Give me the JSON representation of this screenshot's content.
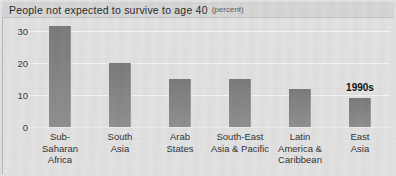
{
  "title": {
    "main": "People not expected to survive to age 40",
    "unit": "(percent)"
  },
  "annotation": {
    "text": "1990s"
  },
  "colors": {
    "bar": "#848484",
    "background": "#e2e2e2",
    "title_band": "#d6d6d6",
    "gridline": "#f4f4f4",
    "text": "#333333"
  },
  "chart_data": {
    "type": "bar",
    "title": "People not expected to survive to age 40 (percent)",
    "xlabel": "",
    "ylabel": "",
    "ylim": [
      0,
      33
    ],
    "yticks": [
      0,
      10,
      20,
      30
    ],
    "ytick_labels": [
      "0",
      "10",
      "20",
      "30"
    ],
    "grid": true,
    "legend": null,
    "annotations": [
      {
        "text": "1990s",
        "category": "East Asia",
        "position": "above-bar"
      }
    ],
    "categories": [
      "Sub-Saharan Africa",
      "South Asia",
      "Arab States",
      "South-East Asia & Pacific",
      "Latin America & Caribbean",
      "East Asia"
    ],
    "category_label_lines": [
      [
        "Sub-",
        "Saharan",
        "Africa"
      ],
      [
        "South",
        "Asia"
      ],
      [
        "Arab",
        "States"
      ],
      [
        "South-East",
        "Asia & Pacific"
      ],
      [
        "Latin",
        "America &",
        "Caribbean"
      ],
      [
        "East",
        "Asia"
      ]
    ],
    "values": [
      31.5,
      20.0,
      15.0,
      15.0,
      12.0,
      9.0
    ]
  }
}
